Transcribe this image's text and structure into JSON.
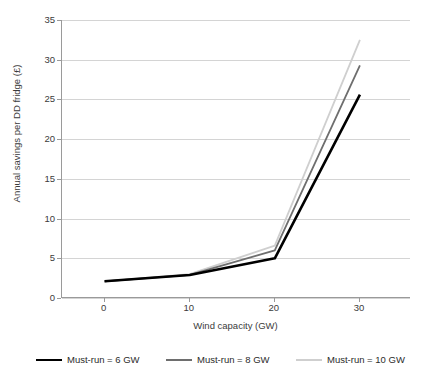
{
  "chart_data": {
    "type": "line",
    "title": "",
    "xlabel": "Wind capacity (GW)",
    "ylabel": "Annual savings per DD fridge (£)",
    "x": [
      0,
      10,
      20,
      30
    ],
    "xticks": [
      "0",
      "10",
      "20",
      "30"
    ],
    "xlim": [
      -5,
      36
    ],
    "yticks": [
      "0",
      "5",
      "10",
      "15",
      "20",
      "25",
      "30",
      "35"
    ],
    "ylim": [
      0,
      35
    ],
    "grid": "horizontal",
    "legend_position": "bottom",
    "series": [
      {
        "name": "Must-run = 6 GW",
        "values": [
          2.1,
          2.9,
          5.0,
          25.6
        ],
        "color": "#000000",
        "width": 2.6
      },
      {
        "name": "Must-run = 8 GW",
        "values": [
          2.1,
          2.9,
          6.0,
          29.3
        ],
        "color": "#6e6e6e",
        "width": 1.8
      },
      {
        "name": "Must-run = 10 GW",
        "values": [
          2.1,
          3.0,
          6.6,
          32.5
        ],
        "color": "#cfcfcf",
        "width": 1.8
      }
    ]
  }
}
